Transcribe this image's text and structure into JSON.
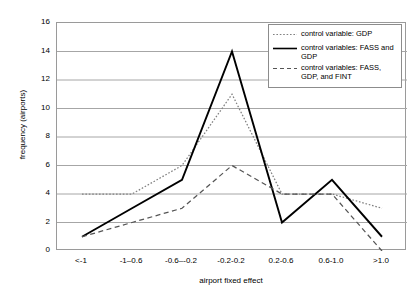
{
  "chart_data": {
    "type": "line",
    "title": "",
    "xlabel": "airport fixed effect",
    "ylabel": "frequency (airports)",
    "categories": [
      "<-1",
      "-1–0.6",
      "-0.6–-0.2",
      "-0.2-0.2",
      "0.2-0.6",
      "0.6-1.0",
      ">1.0"
    ],
    "ylim": [
      0,
      16
    ],
    "yticks": [
      0,
      2,
      4,
      6,
      8,
      10,
      12,
      14,
      16
    ],
    "grid": "horizontal",
    "legend_position": "top-right",
    "series": [
      {
        "name": "control variable: GDP",
        "style": "dotted",
        "color": "#808080",
        "values": [
          4,
          4,
          6,
          11,
          4,
          4,
          3
        ]
      },
      {
        "name": "control variables: FASS and GDP",
        "style": "solid",
        "color": "#000000",
        "values": [
          1,
          3,
          5,
          14,
          2,
          5,
          1
        ]
      },
      {
        "name": "control variables: FASS, GDP, and FINT",
        "style": "dashed",
        "color": "#555555",
        "values": [
          1,
          2,
          3,
          6,
          4,
          4,
          0
        ]
      }
    ]
  },
  "axis": {
    "y_tick_labels": [
      "16",
      "14",
      "12",
      "10",
      "8",
      "6",
      "4",
      "2",
      "0"
    ],
    "x_tick_labels": [
      "<-1",
      "-1–0.6",
      "-0.6–-0.2",
      "-0.2-0.2",
      "0.2-0.6",
      "0.6-1.0",
      ">1.0"
    ],
    "x_title": "airport fixed effect",
    "y_title": "frequency (airports)"
  },
  "legend": {
    "entries": [
      {
        "label": "control variable: GDP",
        "style": "dotted"
      },
      {
        "label": "control variables: FASS and GDP",
        "style": "solid"
      },
      {
        "label": "control variables: FASS, GDP, and FINT",
        "style": "dashed"
      }
    ]
  }
}
